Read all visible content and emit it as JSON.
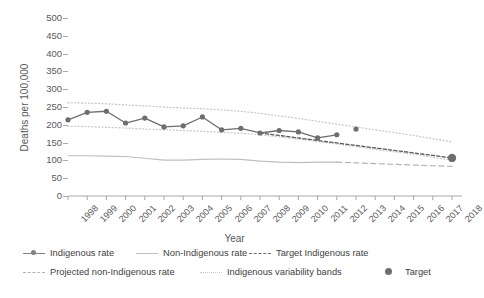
{
  "chart_data": {
    "type": "line",
    "title": "",
    "xlabel": "Year",
    "ylabel": "Deaths per 100,000",
    "ylim": [
      0,
      500
    ],
    "ytick_values": [
      0,
      50,
      100,
      150,
      200,
      250,
      300,
      350,
      400,
      450,
      500
    ],
    "ytick_labels": [
      "0",
      "50",
      "100",
      "150",
      "200",
      "250",
      "300",
      "350",
      "400",
      "450",
      "500"
    ],
    "x": [
      1998,
      1999,
      2000,
      2001,
      2002,
      2003,
      2004,
      2005,
      2006,
      2007,
      2008,
      2009,
      2010,
      2011,
      2012,
      2013,
      2014,
      2015,
      2016,
      2017,
      2018
    ],
    "xtick_labels": [
      "1998",
      "1999",
      "2000",
      "2001",
      "2002",
      "2003",
      "2004",
      "2005",
      "2006",
      "2007",
      "2008",
      "2009",
      "2010",
      "2011",
      "2012",
      "2013",
      "2014",
      "2015",
      "2016",
      "2017",
      "2018"
    ],
    "grid": false,
    "legend_position": "bottom",
    "series": [
      {
        "name": "Indigenous rate",
        "style": "solid-markers",
        "color": "#6d6e71",
        "x": [
          1998,
          1999,
          2000,
          2001,
          2002,
          2003,
          2004,
          2005,
          2006,
          2007,
          2008,
          2009,
          2010,
          2011,
          2012,
          2013
        ],
        "values": [
          214,
          235,
          238,
          205,
          219,
          194,
          197,
          222,
          186,
          190,
          177,
          184,
          180,
          163,
          172,
          188
        ]
      },
      {
        "name": "Non-Indigenous rate",
        "style": "solid",
        "color": "#bcbec0",
        "x": [
          1998,
          1999,
          2000,
          2001,
          2002,
          2003,
          2004,
          2005,
          2006,
          2007,
          2008,
          2009,
          2010,
          2011,
          2012
        ],
        "values": [
          113,
          113,
          112,
          111,
          106,
          101,
          101,
          103,
          104,
          103,
          98,
          95,
          94,
          95,
          95
        ]
      },
      {
        "name": "Target Indigenous rate",
        "style": "dashed",
        "color": "#58595b",
        "x": [
          2008,
          2009,
          2010,
          2011,
          2012,
          2013,
          2014,
          2015,
          2016,
          2017,
          2018
        ],
        "values": [
          177,
          170,
          163,
          156,
          149,
          142,
          135,
          128,
          121,
          114,
          107
        ]
      },
      {
        "name": "Projected non-Indigenous rate",
        "style": "dashed",
        "color": "#b1b3b6",
        "x": [
          2012,
          2013,
          2014,
          2015,
          2016,
          2017,
          2018
        ],
        "values": [
          95,
          93,
          91,
          89,
          87,
          85,
          83
        ]
      },
      {
        "name": "Indigenous variability bands",
        "style": "dotted",
        "color": "#c7c9cb",
        "x": [
          1998,
          1999,
          2000,
          2001,
          2002,
          2003,
          2004,
          2005,
          2006,
          2007,
          2008,
          2009,
          2010,
          2011,
          2012,
          2013,
          2014,
          2015,
          2016,
          2017,
          2018
        ],
        "upper": [
          262,
          261,
          259,
          256,
          253,
          250,
          247,
          245,
          242,
          238,
          232,
          225,
          218,
          210,
          202,
          194,
          186,
          178,
          170,
          161,
          152
        ],
        "lower": [
          196,
          195,
          193,
          191,
          188,
          186,
          184,
          182,
          179,
          176,
          172,
          166,
          160,
          153,
          146,
          139,
          131,
          124,
          117,
          109,
          101
        ]
      },
      {
        "name": "Target",
        "style": "point",
        "color": "#6d6e71",
        "x": [
          2018
        ],
        "values": [
          107
        ]
      }
    ]
  },
  "axes": {
    "y_title": "Deaths per 100,000",
    "x_title": "Year"
  },
  "legend": {
    "row1": [
      {
        "label": "Indigenous rate",
        "marker": "line-marker"
      },
      {
        "label": "Non-Indigenous rate",
        "marker": "line-light"
      },
      {
        "label": "Target Indigenous rate",
        "marker": "dashed-dark"
      }
    ],
    "row2": [
      {
        "label": "Projected non-Indigenous rate",
        "marker": "dashed-light"
      },
      {
        "label": "Indigenous variability bands",
        "marker": "dotted-light"
      },
      {
        "label": "Target",
        "marker": "big-dot"
      }
    ]
  },
  "colors": {
    "indigenous": "#6d6e71",
    "non_indigenous": "#bcbec0",
    "target_line": "#58595b",
    "projected": "#b1b3b6",
    "bands": "#c7c9cb",
    "axis": "#a7a9ac",
    "text": "#58595b"
  }
}
